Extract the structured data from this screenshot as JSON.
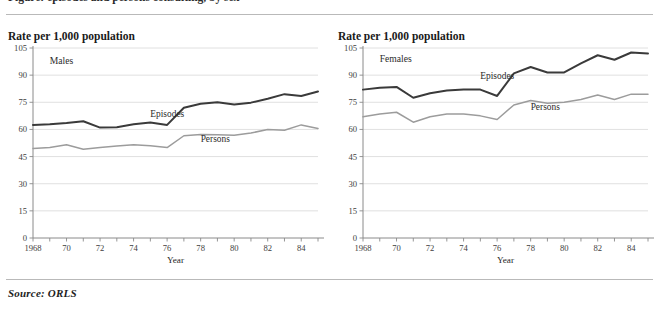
{
  "header": {
    "cropped_heading": "Figure: episodes and persons consulting, by sex"
  },
  "source_note": "Source:  ORLS",
  "colors": {
    "episodes_line": "#3a3a3a",
    "persons_line": "#9c9c9c",
    "gridline": "#d8d8d8",
    "axis": "#8a8a8a",
    "rule": "#b9b9b9"
  },
  "chart_data": [
    {
      "type": "line",
      "title": "Rate per 1,000 population",
      "panel_label": "Males",
      "xlabel": "Year",
      "ylabel": "",
      "ylim": [
        0,
        105
      ],
      "yticks": [
        0,
        15,
        30,
        45,
        60,
        75,
        90,
        105
      ],
      "ytick_labels": [
        "0",
        "15",
        "30",
        "45",
        "60",
        "75",
        "90",
        "105"
      ],
      "grid": true,
      "legend_position": "inline-annotation",
      "x": [
        1968,
        1969,
        1970,
        1971,
        1972,
        1973,
        1974,
        1975,
        1976,
        1977,
        1978,
        1979,
        1980,
        1981,
        1982,
        1983,
        1984,
        1985
      ],
      "xtick_labels": [
        "1968",
        "",
        "70",
        "",
        "72",
        "",
        "74",
        "",
        "76",
        "",
        "78",
        "",
        "80",
        "",
        "82",
        "",
        "84",
        ""
      ],
      "series": [
        {
          "name": "Episodes",
          "color": "#3a3a3a",
          "values": [
            62.5,
            62.8,
            63.5,
            64.5,
            61.0,
            61.2,
            62.8,
            63.8,
            62.5,
            72.0,
            74.2,
            75.0,
            73.8,
            74.8,
            77.0,
            79.5,
            78.5,
            81.0
          ]
        },
        {
          "name": "Persons",
          "color": "#9c9c9c",
          "values": [
            49.5,
            50.0,
            51.5,
            49.0,
            50.0,
            50.8,
            51.5,
            51.0,
            50.0,
            56.5,
            57.2,
            57.0,
            56.8,
            58.0,
            60.0,
            59.5,
            62.5,
            60.5
          ]
        }
      ],
      "annotations": [
        {
          "text": "Episodes",
          "x_approx": 1975,
          "y_approx": 67
        },
        {
          "text": "Persons",
          "x_approx": 1978,
          "y_approx": 53
        },
        {
          "text": "Males",
          "x_approx": 1969,
          "y_approx": 96
        }
      ]
    },
    {
      "type": "line",
      "title": "Rate per 1,000 population",
      "panel_label": "Females",
      "xlabel": "Year",
      "ylabel": "",
      "ylim": [
        0,
        105
      ],
      "yticks": [
        0,
        15,
        30,
        45,
        60,
        75,
        90,
        105
      ],
      "ytick_labels": [
        "0",
        "15",
        "30",
        "45",
        "60",
        "75",
        "90",
        "105"
      ],
      "grid": true,
      "legend_position": "inline-annotation",
      "x": [
        1968,
        1969,
        1970,
        1971,
        1972,
        1973,
        1974,
        1975,
        1976,
        1977,
        1978,
        1979,
        1980,
        1981,
        1982,
        1983,
        1984,
        1985
      ],
      "xtick_labels": [
        "1968",
        "",
        "70",
        "",
        "72",
        "",
        "74",
        "",
        "76",
        "",
        "78",
        "",
        "80",
        "",
        "82",
        "",
        "84",
        ""
      ],
      "series": [
        {
          "name": "Episodes",
          "color": "#3a3a3a",
          "values": [
            82.0,
            83.0,
            83.5,
            77.5,
            80.0,
            81.5,
            82.0,
            82.0,
            78.5,
            91.0,
            94.5,
            91.5,
            91.5,
            96.5,
            101.0,
            98.5,
            102.5,
            102.0
          ]
        },
        {
          "name": "Persons",
          "color": "#9c9c9c",
          "values": [
            67.0,
            68.5,
            69.5,
            64.0,
            67.0,
            68.5,
            68.5,
            67.5,
            65.5,
            73.5,
            76.0,
            74.5,
            75.0,
            76.5,
            79.0,
            76.5,
            79.5,
            79.5
          ]
        }
      ],
      "annotations": [
        {
          "text": "Episodes",
          "x_approx": 1975,
          "y_approx": 88
        },
        {
          "text": "Persons",
          "x_approx": 1978,
          "y_approx": 71
        },
        {
          "text": "Females",
          "x_approx": 1969,
          "y_approx": 97
        }
      ]
    }
  ]
}
